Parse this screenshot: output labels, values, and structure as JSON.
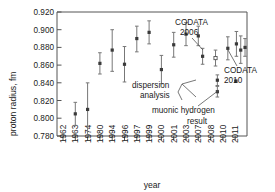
{
  "chart_data": {
    "type": "scatter",
    "title": "",
    "xlabel": "year",
    "ylabel": "proton radius, fm",
    "ylim": [
      0.78,
      0.92
    ],
    "yticks": [
      "0.780",
      "0.800",
      "0.820",
      "0.840",
      "0.860",
      "0.880",
      "0.900",
      "0.920"
    ],
    "ytick_values": [
      0.78,
      0.8,
      0.82,
      0.84,
      0.86,
      0.88,
      0.9,
      0.92
    ],
    "grid": false,
    "legend": "none",
    "categories": [
      "1962",
      "1963",
      "1974",
      "1980",
      "1994",
      "1996",
      "1997",
      "1999",
      "2000",
      "2001",
      "2003",
      "2007",
      "2008",
      "2010",
      "2011"
    ],
    "points": [
      {
        "x_index": 1,
        "year": "1963",
        "value": 0.805,
        "err_low": 0.013,
        "err_high": 0.013,
        "marker": "filled"
      },
      {
        "x_index": 2,
        "year": "1974",
        "value": 0.81,
        "err_low": 0.03,
        "err_high": 0.03,
        "marker": "filled"
      },
      {
        "x_index": 3,
        "year": "1980",
        "value": 0.862,
        "err_low": 0.012,
        "err_high": 0.012,
        "marker": "filled"
      },
      {
        "x_index": 4,
        "year": "1994",
        "value": 0.877,
        "err_low": 0.024,
        "err_high": 0.023,
        "marker": "filled"
      },
      {
        "x_index": 5,
        "year": "1996",
        "value": 0.861,
        "err_low": 0.02,
        "err_high": 0.02,
        "marker": "filled"
      },
      {
        "x_index": 6,
        "year": "1997",
        "value": 0.89,
        "err_low": 0.015,
        "err_high": 0.014,
        "marker": "filled"
      },
      {
        "x_index": 7,
        "year": "1999",
        "value": 0.897,
        "err_low": 0.013,
        "err_high": 0.013,
        "marker": "filled"
      },
      {
        "x_index": 8,
        "year": "2000",
        "value": 0.855,
        "err_low": 0.016,
        "err_high": 0.016,
        "marker": "filled"
      },
      {
        "x_index": 9,
        "year": "2001",
        "value": 0.883,
        "err_low": 0.014,
        "err_high": 0.014,
        "marker": "filled"
      },
      {
        "x_index": 10,
        "year": "2003",
        "value": 0.895,
        "err_low": 0.013,
        "err_high": 0.013,
        "marker": "filled"
      },
      {
        "x_index": 11,
        "year": "2007",
        "value": 0.893,
        "err_low": 0.011,
        "err_high": 0.011,
        "marker": "filled"
      },
      {
        "x_index": 11.35,
        "year": "2007",
        "value": 0.87,
        "err_low": 0.009,
        "err_high": 0.009,
        "marker": "filled"
      },
      {
        "x_index": 12.4,
        "year": "2008",
        "value": 0.868,
        "err_low": 0.009,
        "err_high": 0.009,
        "marker": "open"
      },
      {
        "x_index": 13.4,
        "year": "2010",
        "value": 0.879,
        "err_low": 0.013,
        "err_high": 0.013,
        "marker": "filled"
      },
      {
        "x_index": 14.1,
        "year": "2011",
        "value": 0.884,
        "err_low": 0.014,
        "err_high": 0.014,
        "marker": "filled"
      },
      {
        "x_index": 14.45,
        "year": "2011",
        "value": 0.877,
        "err_low": 0.015,
        "err_high": 0.016,
        "marker": "filled"
      },
      {
        "x_index": 14.8,
        "year": "2011",
        "value": 0.88,
        "err_low": 0.01,
        "err_high": 0.01,
        "marker": "filled"
      },
      {
        "x_index": 12.55,
        "year": "2008",
        "value": 0.843,
        "err_low": 0.006,
        "err_high": 0.006,
        "marker": "filled",
        "group": "dispersion-analysis"
      },
      {
        "x_index": 12.55,
        "year": "2008",
        "value": 0.83,
        "err_low": 0.006,
        "err_high": 0.006,
        "marker": "filled",
        "group": "dispersion-analysis"
      },
      {
        "x_index": 14.05,
        "year": "2010",
        "value": 0.842,
        "err_low": 0.001,
        "err_high": 0.001,
        "marker": "filled",
        "group": "muonic-hydrogen"
      }
    ],
    "annotations": [
      {
        "id": "codata-2006",
        "text_line1": "CODATA",
        "text_line2": "2006",
        "target_year": "2008"
      },
      {
        "id": "codata-2010",
        "text_line1": "CODATA",
        "text_line2": "2010",
        "target_year": "2011"
      },
      {
        "id": "dispersion-analysis",
        "text_line1": "dispersion",
        "text_line2": "analysis",
        "target_year": "2008"
      },
      {
        "id": "muonic-hydrogen",
        "text_line1": "muonic hydrogen",
        "text_line2": "result",
        "target_year": "2010"
      }
    ]
  },
  "axis": {
    "y_title": "proton radius, fm",
    "x_title": "year"
  }
}
